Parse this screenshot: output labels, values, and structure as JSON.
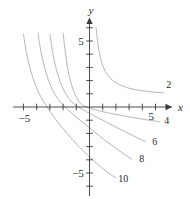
{
  "figure": {
    "type": "math-graph",
    "background": "#ffffff",
    "axis_color": "#3a3a3a",
    "curve_color": "#a9a9a9",
    "label_color": "#2b2b2b"
  },
  "axes": {
    "x": {
      "name": "x",
      "arrow": true,
      "tick_labels": [
        {
          "text": "−5",
          "value": -5
        },
        {
          "text": "5",
          "value": 5
        }
      ],
      "ticks": [
        -6,
        -5,
        -4,
        -3,
        -2,
        -1,
        1,
        2,
        3,
        4,
        5,
        6
      ],
      "range": [
        -7,
        7
      ]
    },
    "y": {
      "name": "y",
      "arrow": true,
      "tick_labels": [
        {
          "text": "5",
          "value": 5
        },
        {
          "text": "−5",
          "value": -5
        }
      ],
      "ticks": [
        -6,
        -5,
        -4,
        -3,
        -2,
        -1,
        1,
        2,
        3,
        4,
        5,
        6
      ],
      "range": [
        -7,
        7
      ]
    }
  },
  "chart_data": {
    "type": "line",
    "title": "",
    "xlabel": "x",
    "ylabel": "y",
    "xlim": [
      -7,
      7
    ],
    "ylim": [
      -7,
      7
    ],
    "grid": false,
    "legend": "inline-end-labels",
    "series": [
      {
        "name": "2",
        "label": "2",
        "label_x": 6.0,
        "label_y": 1.45,
        "points": [
          [
            0.4,
            7.2
          ],
          [
            0.5,
            6.0
          ],
          [
            0.62,
            4.9
          ],
          [
            0.75,
            4.1
          ],
          [
            0.95,
            3.3
          ],
          [
            1.2,
            2.7
          ],
          [
            1.55,
            2.2
          ],
          [
            2.0,
            1.85
          ],
          [
            2.6,
            1.55
          ],
          [
            3.3,
            1.35
          ],
          [
            4.1,
            1.22
          ],
          [
            5.0,
            1.12
          ],
          [
            5.6,
            1.08
          ]
        ]
      },
      {
        "name": "4",
        "label": "4",
        "label_x": 5.85,
        "label_y": -1.25,
        "points": [
          [
            -2.15,
            7.2
          ],
          [
            -2.0,
            5.6
          ],
          [
            -1.85,
            4.3
          ],
          [
            -1.7,
            3.2
          ],
          [
            -1.5,
            2.2
          ],
          [
            -1.25,
            1.35
          ],
          [
            -1.0,
            0.75
          ],
          [
            -0.7,
            0.3
          ],
          [
            -0.35,
            0.05
          ],
          [
            0.0,
            -0.08
          ],
          [
            0.6,
            -0.25
          ],
          [
            1.3,
            -0.42
          ],
          [
            2.2,
            -0.6
          ],
          [
            3.1,
            -0.76
          ],
          [
            4.0,
            -0.92
          ],
          [
            4.85,
            -1.05
          ],
          [
            5.3,
            -1.12
          ]
        ]
      },
      {
        "name": "6",
        "label": "6",
        "label_x": 4.95,
        "label_y": -2.85,
        "points": [
          [
            -3.2,
            7.2
          ],
          [
            -3.0,
            5.5
          ],
          [
            -2.8,
            4.2
          ],
          [
            -2.6,
            3.2
          ],
          [
            -2.35,
            2.3
          ],
          [
            -2.05,
            1.5
          ],
          [
            -1.7,
            0.85
          ],
          [
            -1.3,
            0.35
          ],
          [
            -0.85,
            0.0
          ],
          [
            -0.4,
            -0.25
          ],
          [
            0.0,
            -0.48
          ],
          [
            0.6,
            -0.8
          ],
          [
            1.3,
            -1.15
          ],
          [
            2.05,
            -1.55
          ],
          [
            2.85,
            -1.95
          ],
          [
            3.6,
            -2.32
          ],
          [
            4.25,
            -2.62
          ]
        ]
      },
      {
        "name": "8",
        "label": "8",
        "label_x": 3.95,
        "label_y": -4.2,
        "points": [
          [
            -4.1,
            7.2
          ],
          [
            -3.9,
            5.6
          ],
          [
            -3.7,
            4.3
          ],
          [
            -3.45,
            3.2
          ],
          [
            -3.2,
            2.3
          ],
          [
            -2.9,
            1.5
          ],
          [
            -2.55,
            0.85
          ],
          [
            -2.15,
            0.3
          ],
          [
            -1.7,
            -0.15
          ],
          [
            -1.2,
            -0.6
          ],
          [
            -0.65,
            -1.05
          ],
          [
            -0.1,
            -1.5
          ],
          [
            0.5,
            -1.98
          ],
          [
            1.15,
            -2.5
          ],
          [
            1.85,
            -3.02
          ],
          [
            2.55,
            -3.52
          ],
          [
            3.2,
            -3.95
          ]
        ]
      },
      {
        "name": "10",
        "label": "10",
        "label_x": 2.55,
        "label_y": -5.65,
        "points": [
          [
            -5.2,
            7.2
          ],
          [
            -5.0,
            5.5
          ],
          [
            -4.8,
            4.2
          ],
          [
            -4.55,
            3.1
          ],
          [
            -4.25,
            2.1
          ],
          [
            -3.9,
            1.2
          ],
          [
            -3.5,
            0.45
          ],
          [
            -3.05,
            -0.25
          ],
          [
            -2.55,
            -0.95
          ],
          [
            -2.0,
            -1.65
          ],
          [
            -1.45,
            -2.3
          ],
          [
            -0.85,
            -2.95
          ],
          [
            -0.25,
            -3.55
          ],
          [
            0.35,
            -4.1
          ],
          [
            0.95,
            -4.62
          ],
          [
            1.55,
            -5.08
          ],
          [
            2.0,
            -5.38
          ]
        ]
      }
    ]
  }
}
